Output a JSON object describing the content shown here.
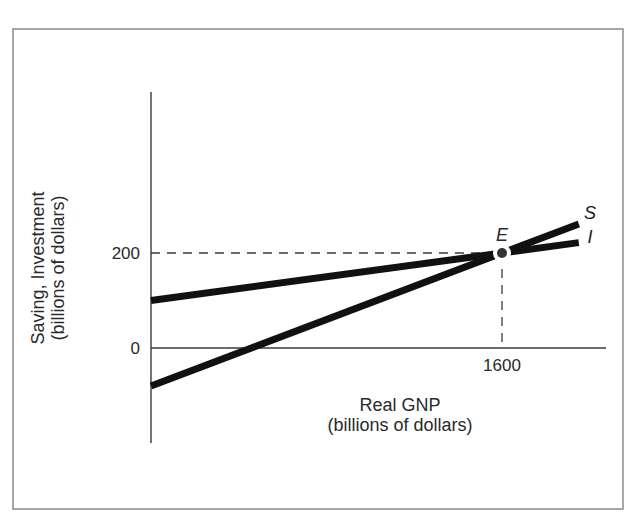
{
  "chart_data": {
    "type": "line",
    "title": "",
    "xlabel": "Real GNP (billions of dollars)",
    "xlabel_lines": [
      "Real GNP",
      "(billions of dollars)"
    ],
    "ylabel": "Saving, Investment (billions of dollars)",
    "ylabel_lines": [
      "Saving, Investment",
      "(billions of dollars)"
    ],
    "x_ticks": [
      {
        "value": 1600,
        "label": "1600"
      }
    ],
    "y_ticks": [
      {
        "value": 0,
        "label": "0"
      },
      {
        "value": 200,
        "label": "200"
      }
    ],
    "xlim": [
      0,
      2060
    ],
    "ylim": [
      -200,
      540
    ],
    "grid": false,
    "legend": "inline labels at line ends",
    "series": [
      {
        "name": "S",
        "label": "S",
        "description": "Saving",
        "x": [
          0,
          1600,
          1950
        ],
        "values": [
          -80,
          200,
          261
        ]
      },
      {
        "name": "I",
        "label": "I",
        "description": "Investment",
        "x": [
          0,
          1600,
          1950
        ],
        "values": [
          100,
          200,
          222
        ]
      }
    ],
    "annotations": [
      {
        "label": "E",
        "type": "equilibrium-point",
        "x": 1600,
        "y": 200
      },
      {
        "type": "dashed-guide",
        "from": [
          0,
          200
        ],
        "to": [
          1600,
          200
        ]
      },
      {
        "type": "dashed-guide",
        "from": [
          1600,
          200
        ],
        "to": [
          1600,
          0
        ]
      }
    ]
  }
}
